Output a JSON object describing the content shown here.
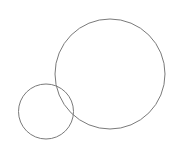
{
  "canvas": {
    "width": 179,
    "height": 151,
    "background": "#ffffff"
  },
  "diagram": {
    "type": "overlapping-circles",
    "stroke_color": "#7a7a7a",
    "stroke_width": 1,
    "shapes": [
      {
        "name": "large-circle",
        "cx": 110,
        "cy": 74,
        "r": 55
      },
      {
        "name": "small-circle",
        "cx": 46,
        "cy": 111.5,
        "r": 27.5
      }
    ]
  }
}
